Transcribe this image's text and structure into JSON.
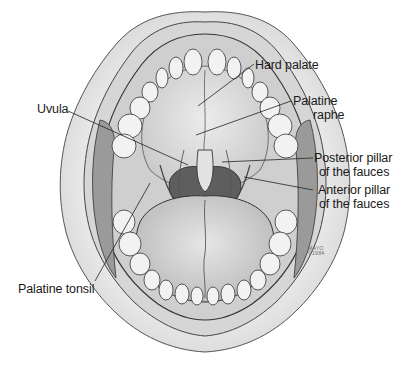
{
  "diagram": {
    "labels": [
      {
        "id": "hard-palate",
        "lines": [
          "Hard palate"
        ]
      },
      {
        "id": "palatine-raphe",
        "lines": [
          "Palatine",
          "raphe"
        ]
      },
      {
        "id": "uvula",
        "lines": [
          "Uvula"
        ]
      },
      {
        "id": "posterior-pillar",
        "lines": [
          "Posterior pillar",
          "of the fauces"
        ]
      },
      {
        "id": "anterior-pillar",
        "lines": [
          "Anterior pillar",
          "of the fauces"
        ]
      },
      {
        "id": "palatine-tonsil",
        "lines": [
          "Palatine tonsil"
        ]
      }
    ],
    "signature": {
      "line1": "MAYO",
      "line2": "©1984"
    }
  },
  "colors": {
    "background": "#ffffff",
    "lip": "#e6e6e6",
    "lip_shadow": "#cfcfcf",
    "gum": "#d8d8d8",
    "palate": "#dcdcdc",
    "tooth": "#f2f2f2",
    "tongue": "#d4d4d4",
    "throat": "#6b6b6b",
    "outline": "#333333",
    "label_text": "#1a1a1a"
  }
}
